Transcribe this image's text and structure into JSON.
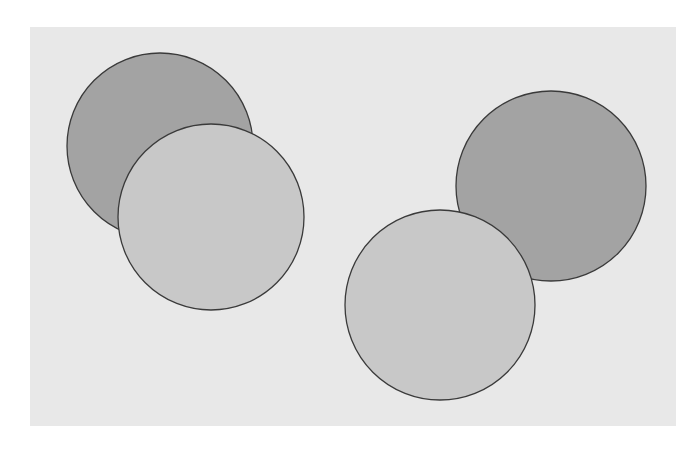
{
  "canvas": {
    "width": 698,
    "height": 453,
    "background": "#ffffff"
  },
  "panel": {
    "x": 30,
    "y": 27,
    "width": 646,
    "height": 399,
    "fill": "#e8e8e8"
  },
  "colors": {
    "dark": "#a3a3a3",
    "light": "#c8c8c8",
    "stroke": "#3a3a3a"
  },
  "circles": [
    {
      "id": "dark-left",
      "shade": "dark",
      "cx": 160,
      "cy": 146,
      "r": 93,
      "fill": "#a3a3a3",
      "stroke": "#3a3a3a"
    },
    {
      "id": "light-left",
      "shade": "light",
      "cx": 211,
      "cy": 217,
      "r": 93,
      "fill": "#c8c8c8",
      "stroke": "#3a3a3a"
    },
    {
      "id": "dark-right",
      "shade": "dark",
      "cx": 551,
      "cy": 186,
      "r": 95,
      "fill": "#a3a3a3",
      "stroke": "#3a3a3a"
    },
    {
      "id": "light-right",
      "shade": "light",
      "cx": 440,
      "cy": 305,
      "r": 95,
      "fill": "#c8c8c8",
      "stroke": "#3a3a3a"
    }
  ]
}
